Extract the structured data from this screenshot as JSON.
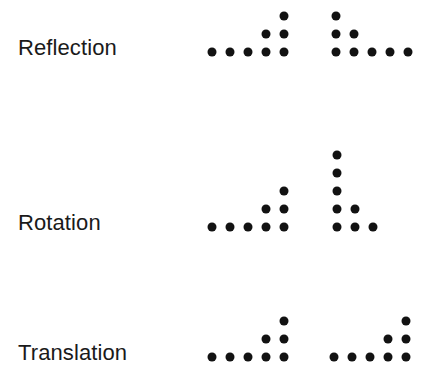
{
  "figure": {
    "background_color": "#ffffff",
    "dot_color": "#121212",
    "label_color": "#1a1a1a",
    "grid_cell_px": 18,
    "dot_diameter_px": 9,
    "rows": [
      {
        "id": "reflection",
        "label": "Reflection",
        "label_baseline_y": 48,
        "figures": [
          {
            "id": "reflection-source",
            "role": "source",
            "origin_x": 212,
            "origin_y": 52,
            "cells": [
              [
                0,
                0
              ],
              [
                1,
                0
              ],
              [
                2,
                0
              ],
              [
                3,
                0
              ],
              [
                4,
                0
              ],
              [
                3,
                1
              ],
              [
                4,
                1
              ],
              [
                4,
                2
              ]
            ]
          },
          {
            "id": "reflection-image",
            "role": "reflected",
            "origin_x": 336,
            "origin_y": 52,
            "cells": [
              [
                0,
                0
              ],
              [
                1,
                0
              ],
              [
                2,
                0
              ],
              [
                3,
                0
              ],
              [
                4,
                0
              ],
              [
                0,
                1
              ],
              [
                1,
                1
              ],
              [
                0,
                2
              ]
            ]
          }
        ]
      },
      {
        "id": "rotation",
        "label": "Rotation",
        "label_baseline_y": 223,
        "figures": [
          {
            "id": "rotation-source",
            "role": "source",
            "origin_x": 212,
            "origin_y": 227,
            "cells": [
              [
                0,
                0
              ],
              [
                1,
                0
              ],
              [
                2,
                0
              ],
              [
                3,
                0
              ],
              [
                4,
                0
              ],
              [
                3,
                1
              ],
              [
                4,
                1
              ],
              [
                4,
                2
              ]
            ]
          },
          {
            "id": "rotation-image",
            "role": "rotated",
            "origin_x": 337,
            "origin_y": 227,
            "cells": [
              [
                0,
                0
              ],
              [
                1,
                0
              ],
              [
                2,
                0
              ],
              [
                0,
                1
              ],
              [
                1,
                1
              ],
              [
                0,
                2
              ],
              [
                0,
                3
              ],
              [
                0,
                4
              ]
            ]
          }
        ]
      },
      {
        "id": "translation",
        "label": "Translation",
        "label_baseline_y": 353,
        "figures": [
          {
            "id": "translation-source",
            "role": "source",
            "origin_x": 212,
            "origin_y": 357,
            "cells": [
              [
                0,
                0
              ],
              [
                1,
                0
              ],
              [
                2,
                0
              ],
              [
                3,
                0
              ],
              [
                4,
                0
              ],
              [
                3,
                1
              ],
              [
                4,
                1
              ],
              [
                4,
                2
              ]
            ]
          },
          {
            "id": "translation-image",
            "role": "translated",
            "origin_x": 334,
            "origin_y": 357,
            "cells": [
              [
                0,
                0
              ],
              [
                1,
                0
              ],
              [
                2,
                0
              ],
              [
                3,
                0
              ],
              [
                4,
                0
              ],
              [
                3,
                1
              ],
              [
                4,
                1
              ],
              [
                4,
                2
              ]
            ]
          }
        ]
      }
    ]
  }
}
